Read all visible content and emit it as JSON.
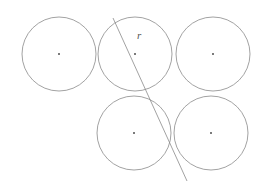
{
  "figure": {
    "canvas": {
      "width": 271,
      "height": 190
    },
    "background_color": "#ffffff",
    "stroke_color": "#8a8a8a",
    "dot_color": "#333333",
    "label_color": "#555555",
    "stroke_width": 0.8,
    "radius": 37,
    "circles": [
      {
        "id": "top-left",
        "cx": 59,
        "cy": 54,
        "r": 37,
        "dot_label": "center-dot"
      },
      {
        "id": "top-middle",
        "cx": 135,
        "cy": 54,
        "r": 37,
        "dot_label": "center-dot"
      },
      {
        "id": "top-right",
        "cx": 213,
        "cy": 54,
        "r": 37,
        "dot_label": "center-dot"
      },
      {
        "id": "bottom-left",
        "cx": 134,
        "cy": 133,
        "r": 37,
        "dot_label": "center-dot"
      },
      {
        "id": "bottom-right",
        "cx": 211,
        "cy": 133,
        "r": 37,
        "dot_label": "center-dot"
      }
    ],
    "line": {
      "id": "radius-secant",
      "x1": 113,
      "y1": 18,
      "x2": 187,
      "y2": 181
    },
    "label": {
      "text": "r",
      "x": 137,
      "y": 36,
      "font_size": 11
    }
  }
}
